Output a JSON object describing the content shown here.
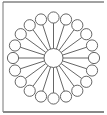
{
  "diagram": {
    "type": "radial-hub-and-spoke",
    "spoke_count": 20,
    "center": {
      "x": 53.5,
      "y": 58
    },
    "hub_radius": 9.5,
    "ring_radius": 40.5,
    "node_radius": 5.6,
    "start_angle_deg": -90,
    "colors": {
      "background": "#ffffff",
      "stroke": "#555555",
      "frame_top": "#444444",
      "frame_left": "#777777",
      "frame_bottom": "#888888",
      "node_fill": "#ffffff"
    },
    "frame": {
      "left": 3,
      "top": 2,
      "right": 104,
      "bottom": 112
    }
  }
}
